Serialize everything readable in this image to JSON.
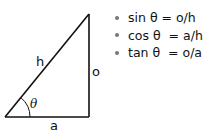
{
  "diagram": {
    "type": "right-triangle",
    "labels": {
      "hypotenuse": "h",
      "opposite": "o",
      "adjacent": "a",
      "angle": "θ"
    },
    "colors": {
      "stroke": "#111111",
      "text": "#111111",
      "bullet": "#777777"
    }
  },
  "formulas": [
    {
      "text": "sin θ = o/h"
    },
    {
      "text": "cos θ  = a/h"
    },
    {
      "text": "tan θ  = o/a"
    }
  ]
}
